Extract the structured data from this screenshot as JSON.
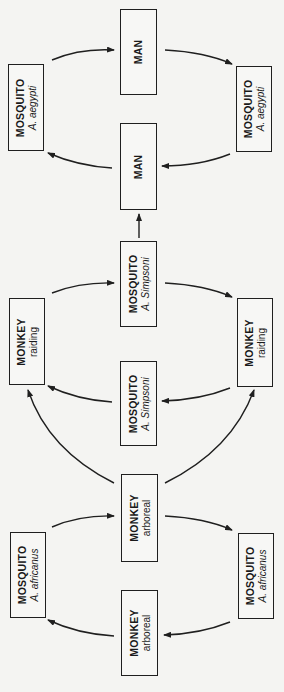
{
  "diagram": {
    "orientation": "rotated 90 degrees counter-clockwise",
    "nodes": {
      "man_top": {
        "title": "MAN",
        "sub": ""
      },
      "man_bottom": {
        "title": "MAN",
        "sub": ""
      },
      "aegypti_left": {
        "title": "MOSQUITO",
        "sub_prefix": "A.",
        "sub_species": "aegypti"
      },
      "aegypti_right": {
        "title": "MOSQUITO",
        "sub_prefix": "A.",
        "sub_species": "aegypti"
      },
      "simpsoni_top": {
        "title": "MOSQUITO",
        "sub_prefix": "A.",
        "sub_species": "Simpsoni"
      },
      "simpsoni_bottom": {
        "title": "MOSQUITO",
        "sub_prefix": "A.",
        "sub_species": "Simpsoni"
      },
      "raiding_left": {
        "title": "MONKEY",
        "sub": "raiding"
      },
      "raiding_right": {
        "title": "MONKEY",
        "sub": "raiding"
      },
      "arboreal_top": {
        "title": "MONKEY",
        "sub": "arboreal"
      },
      "arboreal_bottom": {
        "title": "MONKEY",
        "sub": "arboreal"
      },
      "africanus_left": {
        "title": "MOSQUITO",
        "sub_prefix": "A.",
        "sub_species": "africanus"
      },
      "africanus_right": {
        "title": "MOSQUITO",
        "sub_prefix": "A.",
        "sub_species": "africanus"
      }
    },
    "edges": [
      {
        "from": "aegypti_left",
        "to": "man_top"
      },
      {
        "from": "man_top",
        "to": "aegypti_right"
      },
      {
        "from": "aegypti_right",
        "to": "man_bottom"
      },
      {
        "from": "man_bottom",
        "to": "aegypti_left"
      },
      {
        "from": "simpsoni_top",
        "to": "man_bottom"
      },
      {
        "from": "raiding_left",
        "to": "simpsoni_top"
      },
      {
        "from": "simpsoni_top",
        "to": "raiding_right"
      },
      {
        "from": "raiding_right",
        "to": "simpsoni_bottom"
      },
      {
        "from": "simpsoni_bottom",
        "to": "raiding_left"
      },
      {
        "from": "arboreal_top",
        "to": "raiding_left"
      },
      {
        "from": "arboreal_top",
        "to": "raiding_right"
      },
      {
        "from": "africanus_left",
        "to": "arboreal_top"
      },
      {
        "from": "arboreal_top",
        "to": "africanus_right"
      },
      {
        "from": "africanus_right",
        "to": "arboreal_bottom"
      },
      {
        "from": "arboreal_bottom",
        "to": "africanus_left"
      }
    ],
    "colors": {
      "background": "#f4f4f2",
      "stroke": "#1f1f1f"
    }
  }
}
